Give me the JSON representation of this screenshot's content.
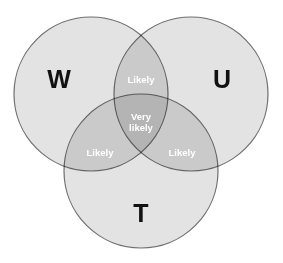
{
  "diagram": {
    "background_color": "#ffffff",
    "stroke_color": "#6e6e6e",
    "fill_color": "#e3e3e3",
    "pair_overlap_color": "#c4c4c4",
    "triple_overlap_color": "#b0b0b0",
    "set_label_color": "#111111",
    "region_label_color": "#ffffff"
  },
  "sets": [
    {
      "key": "w",
      "label": "W",
      "cx": 91,
      "cy": 94,
      "r": 77
    },
    {
      "key": "u",
      "label": "U",
      "cx": 191,
      "cy": 94,
      "r": 77
    },
    {
      "key": "t",
      "label": "T",
      "cx": 141,
      "cy": 171,
      "r": 77
    }
  ],
  "set_labels": {
    "w": "W",
    "u": "U",
    "t": "T"
  },
  "regions": {
    "wu": {
      "line1": "Likely"
    },
    "wt": {
      "line1": "Likely"
    },
    "ut": {
      "line1": "Likely"
    },
    "wut": {
      "line1": "Very",
      "line2": "likely"
    }
  },
  "chart_data": {
    "type": "venn",
    "sets": [
      "W",
      "U",
      "T"
    ],
    "regions": [
      {
        "sets": [
          "W"
        ],
        "label": "W",
        "shade": "light"
      },
      {
        "sets": [
          "U"
        ],
        "label": "U",
        "shade": "light"
      },
      {
        "sets": [
          "T"
        ],
        "label": "T",
        "shade": "light"
      },
      {
        "sets": [
          "W",
          "U"
        ],
        "label": "Likely",
        "shade": "medium"
      },
      {
        "sets": [
          "W",
          "T"
        ],
        "label": "Likely",
        "shade": "medium"
      },
      {
        "sets": [
          "U",
          "T"
        ],
        "label": "Likely",
        "shade": "medium"
      },
      {
        "sets": [
          "W",
          "U",
          "T"
        ],
        "label": "Very likely",
        "shade": "dark"
      }
    ],
    "legend": "none",
    "grid": false
  }
}
